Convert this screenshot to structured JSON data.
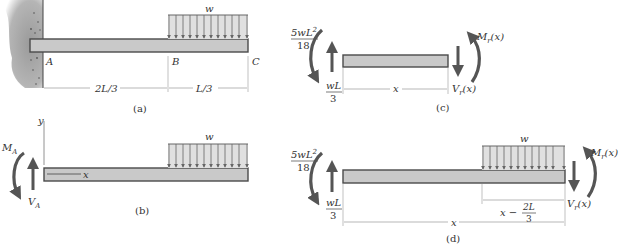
{
  "figure": {
    "panels": [
      {
        "id": "a",
        "caption": "(a)",
        "description": "Cantilever beam fixed at wall A, uniform load w over segment B to C",
        "points": [
          "A",
          "B",
          "C"
        ],
        "load_label": "w",
        "dimensions": [
          "2L/3",
          "L/3"
        ]
      },
      {
        "id": "b",
        "caption": "(b)",
        "description": "Free-body diagram of whole beam with support reactions",
        "axis_y": "y",
        "axis_x": "x",
        "load_label": "w",
        "moment_label": "M",
        "moment_sub": "A",
        "shear_label": "V",
        "shear_sub": "A"
      },
      {
        "id": "c",
        "caption": "(c)",
        "description": "Section 0 < x < 2L/3",
        "left_moment_num": "5wL",
        "left_moment_exp": "2",
        "left_moment_den": "18",
        "left_force_num": "wL",
        "left_force_den": "3",
        "dimension": "x",
        "right_moment": "M",
        "right_moment_sub": "r",
        "right_moment_arg": "(x)",
        "right_shear": "V",
        "right_shear_sub": "r",
        "right_shear_arg": "(x)"
      },
      {
        "id": "d",
        "caption": "(d)",
        "description": "Section 2L/3 < x < L",
        "left_moment_num": "5wL",
        "left_moment_exp": "2",
        "left_moment_den": "18",
        "left_force_num": "wL",
        "left_force_den": "3",
        "load_label": "w",
        "dimension_total": "x",
        "dimension_partial_prefix": "x −",
        "dimension_partial_num": "2L",
        "dimension_partial_den": "3",
        "right_moment": "M",
        "right_moment_sub": "r",
        "right_moment_arg": "(x)",
        "right_shear": "V",
        "right_shear_sub": "r",
        "right_shear_arg": "(x)"
      }
    ],
    "colors": {
      "beam_fill": "#c9c9c9",
      "beam_stroke": "#4a4a4a",
      "arrow": "#555555",
      "dim_line": "#8a8a8a",
      "wall": "#8c8c8c"
    }
  }
}
